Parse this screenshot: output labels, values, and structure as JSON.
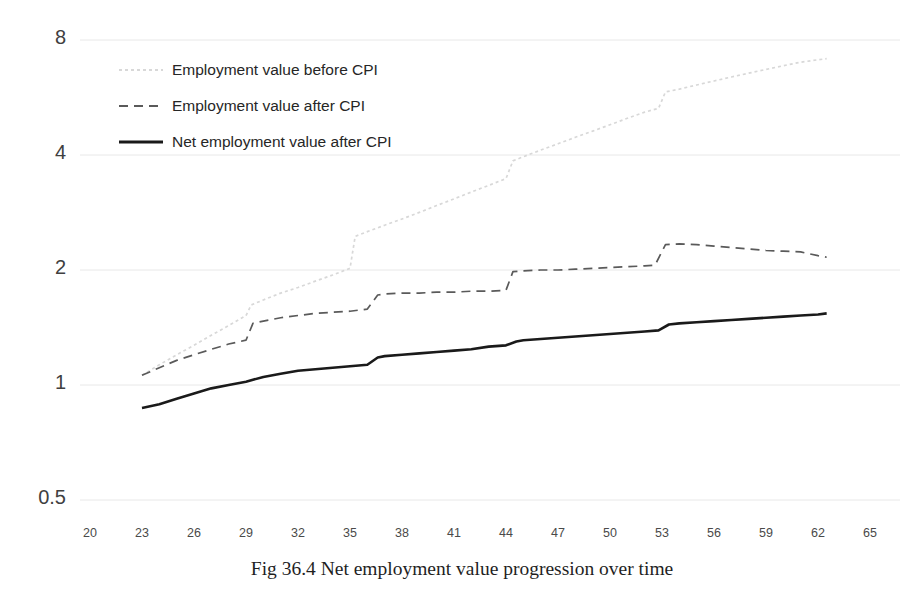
{
  "caption": "Fig 36.4 Net employment value progression over time",
  "legend": [
    {
      "label": "Employment value before CPI",
      "style": "dotted",
      "color": "#d8d8d8",
      "icon": "dotted-line-swatch"
    },
    {
      "label": "Employment value after CPI",
      "style": "dashed",
      "color": "#5a5a5a",
      "icon": "dashed-line-swatch"
    },
    {
      "label": "Net employment value after CPI",
      "style": "solid",
      "color": "#1a1a1a",
      "icon": "solid-line-swatch"
    }
  ],
  "chart_data": {
    "type": "line",
    "title": "",
    "xlabel": "",
    "ylabel": "",
    "yscale": "log",
    "xlim": [
      20,
      65
    ],
    "ylim": [
      0.5,
      8
    ],
    "yticks": [
      0.5,
      1,
      2,
      4,
      8
    ],
    "ytick_labels": [
      "0.5",
      "1",
      "2",
      "4",
      "8"
    ],
    "xticks": [
      20,
      23,
      26,
      29,
      32,
      35,
      38,
      41,
      44,
      47,
      50,
      53,
      56,
      59,
      62,
      65
    ],
    "xtick_labels": [
      "20",
      "23",
      "26",
      "29",
      "32",
      "35",
      "38",
      "41",
      "44",
      "47",
      "50",
      "53",
      "56",
      "59",
      "62",
      "65"
    ],
    "grid": "horizontal",
    "legend_position": "upper-left-inside",
    "series": [
      {
        "name": "Employment value before CPI",
        "style": "dotted",
        "color": "#d8d8d8",
        "x": [
          23.0,
          24.0,
          25.0,
          26.0,
          27.0,
          28.0,
          29.0,
          29.3,
          30.0,
          31.0,
          32.0,
          33.0,
          34.0,
          35.0,
          35.3,
          36.0,
          37.0,
          38.0,
          39.0,
          40.0,
          41.0,
          42.0,
          43.0,
          44.0,
          44.4,
          45.0,
          46.0,
          47.0,
          48.0,
          49.0,
          50.0,
          51.0,
          52.0,
          52.8,
          53.2,
          54.0,
          55.0,
          56.0,
          57.0,
          58.0,
          59.0,
          60.0,
          61.0,
          62.0,
          62.5
        ],
        "y": [
          1.06,
          1.13,
          1.2,
          1.27,
          1.35,
          1.43,
          1.52,
          1.62,
          1.67,
          1.74,
          1.8,
          1.87,
          1.94,
          2.02,
          2.45,
          2.52,
          2.62,
          2.72,
          2.83,
          2.95,
          3.07,
          3.2,
          3.33,
          3.47,
          3.86,
          3.96,
          4.12,
          4.28,
          4.45,
          4.62,
          4.8,
          4.99,
          5.18,
          5.3,
          5.85,
          5.95,
          6.1,
          6.25,
          6.4,
          6.55,
          6.7,
          6.85,
          7.0,
          7.1,
          7.15
        ]
      },
      {
        "name": "Employment value after CPI",
        "style": "dashed",
        "color": "#5a5a5a",
        "x": [
          23.0,
          24.0,
          25.0,
          26.0,
          27.0,
          28.0,
          29.0,
          29.4,
          30.0,
          31.0,
          32.0,
          33.0,
          34.0,
          35.0,
          36.0,
          36.6,
          37.0,
          38.0,
          39.0,
          40.0,
          41.0,
          42.0,
          43.0,
          44.0,
          44.4,
          45.0,
          46.0,
          47.0,
          48.0,
          49.0,
          50.0,
          51.0,
          52.0,
          52.6,
          53.2,
          54.0,
          55.0,
          56.0,
          57.0,
          58.0,
          59.0,
          60.0,
          61.0,
          62.0,
          62.5
        ],
        "y": [
          1.06,
          1.11,
          1.16,
          1.2,
          1.24,
          1.28,
          1.31,
          1.45,
          1.47,
          1.5,
          1.52,
          1.54,
          1.55,
          1.56,
          1.58,
          1.72,
          1.73,
          1.74,
          1.74,
          1.75,
          1.75,
          1.76,
          1.76,
          1.77,
          1.98,
          1.99,
          2.0,
          2.0,
          2.01,
          2.02,
          2.03,
          2.04,
          2.05,
          2.06,
          2.33,
          2.34,
          2.33,
          2.31,
          2.29,
          2.27,
          2.25,
          2.24,
          2.23,
          2.18,
          2.16
        ]
      },
      {
        "name": "Net employment value after CPI",
        "style": "solid",
        "color": "#1a1a1a",
        "x": [
          23.0,
          24.0,
          25.0,
          26.0,
          27.0,
          28.0,
          29.0,
          30.0,
          31.0,
          32.0,
          33.0,
          34.0,
          35.0,
          36.0,
          36.6,
          37.0,
          38.0,
          39.0,
          40.0,
          41.0,
          42.0,
          43.0,
          44.0,
          44.6,
          45.0,
          46.0,
          47.0,
          48.0,
          49.0,
          50.0,
          51.0,
          52.0,
          52.8,
          53.4,
          54.0,
          55.0,
          56.0,
          57.0,
          58.0,
          59.0,
          60.0,
          61.0,
          62.0,
          62.5
        ],
        "y": [
          0.87,
          0.89,
          0.92,
          0.95,
          0.98,
          1.0,
          1.02,
          1.05,
          1.07,
          1.09,
          1.1,
          1.11,
          1.12,
          1.13,
          1.18,
          1.19,
          1.2,
          1.21,
          1.22,
          1.23,
          1.24,
          1.26,
          1.27,
          1.3,
          1.31,
          1.32,
          1.33,
          1.34,
          1.35,
          1.36,
          1.37,
          1.38,
          1.39,
          1.44,
          1.45,
          1.46,
          1.47,
          1.48,
          1.49,
          1.5,
          1.51,
          1.52,
          1.53,
          1.54
        ]
      }
    ]
  },
  "axes_pixels": {
    "plot_left": 80,
    "plot_right": 900,
    "x_at_20": 90,
    "x_step_px": 52,
    "y_map": {
      "0.5": 500,
      "1": 388,
      "2": 275,
      "4": 163,
      "8": 40
    }
  }
}
